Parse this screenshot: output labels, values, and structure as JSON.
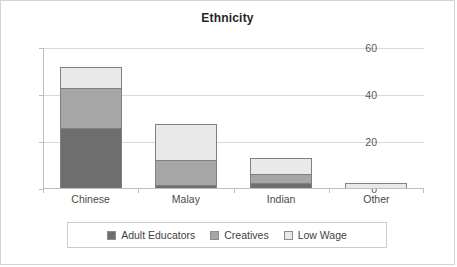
{
  "chart_data": {
    "type": "bar",
    "title": "Ethnicity",
    "xlabel": "",
    "ylabel": "",
    "categories": [
      "Chinese",
      "Malay",
      "Indian",
      "Other"
    ],
    "series": [
      {
        "name": "Adult Educators",
        "values": [
          26,
          1.5,
          2.5,
          0
        ],
        "color": "#6e6e6e"
      },
      {
        "name": "Creatives",
        "values": [
          17,
          11,
          4,
          0
        ],
        "color": "#a6a6a6"
      },
      {
        "name": "Low Wage",
        "values": [
          9,
          15,
          6.5,
          2.5
        ],
        "color": "#e9e9e9"
      }
    ],
    "stacked": true,
    "totals": [
      52,
      27.5,
      13,
      2.5
    ],
    "ylim": [
      0,
      60
    ],
    "yticks": [
      0,
      20,
      40,
      60
    ],
    "ytick_labels": [
      "0",
      "20",
      "40",
      "60"
    ],
    "grid": true,
    "legend_position": "bottom"
  },
  "legend": {
    "items": [
      {
        "label": "Adult Educators",
        "color": "#6e6e6e"
      },
      {
        "label": "Creatives",
        "color": "#a6a6a6"
      },
      {
        "label": "Low Wage",
        "color": "#e9e9e9"
      }
    ]
  }
}
